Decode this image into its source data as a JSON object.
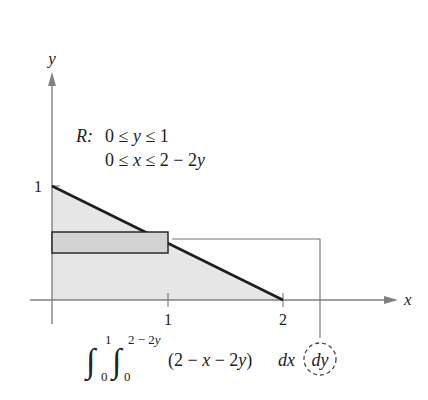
{
  "figure": {
    "axes": {
      "x_label": "x",
      "y_label": "y",
      "x_ticks": [
        "1",
        "2"
      ],
      "y_ticks": [
        "1"
      ]
    },
    "region": {
      "label": "R:",
      "line1": "0 ≤ y ≤ 1",
      "line1_parts": {
        "a": "0 ≤ ",
        "var": "y",
        "b": " ≤ 1"
      },
      "line2": "0 ≤ x ≤ 2 − 2y",
      "line2_parts": {
        "a": "0 ≤ ",
        "var": "x",
        "b": " ≤ 2 − 2",
        "var2": "y"
      }
    },
    "integral": {
      "outer_upper": "1",
      "outer_lower": "0",
      "inner_upper_num": "2 − 2",
      "inner_upper_var": "y",
      "inner_lower": "0",
      "integrand_open": "(2 − ",
      "integrand_x": "x",
      "integrand_mid": " − 2",
      "integrand_y": "y",
      "integrand_close": ")",
      "dx": "dx",
      "dy": "dy",
      "full_text": "∫₀¹ ∫₀^(2−2y) (2 − x − 2y) dx dy"
    },
    "colors": {
      "region_fill": "#e6e6e6",
      "strip_fill": "#d3d3d3",
      "boundary_line": "#1e1e1e",
      "axis_line": "#808080",
      "text": "#222222"
    }
  }
}
